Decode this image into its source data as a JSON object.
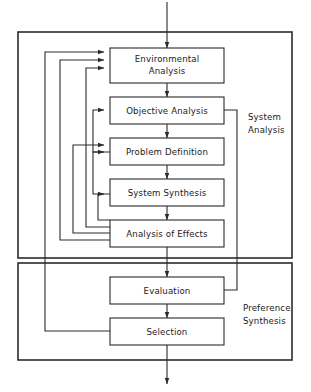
{
  "diagram": {
    "type": "flowchart",
    "colors": {
      "stroke": "#2b2b2b",
      "box_fill": "#ffffff",
      "background": "#ffffff",
      "text": "#1a1a1a"
    },
    "groups": [
      {
        "id": "system-analysis",
        "label_line1": "System",
        "label_line2": "Analysis",
        "label": "System Analysis"
      },
      {
        "id": "preference-synthesis",
        "label_line1": "Preference",
        "label_line2": "Synthesis",
        "label": "Preference Synthesis"
      }
    ],
    "nodes": [
      {
        "id": "environmental-analysis",
        "label_line1": "Environmental",
        "label_line2": "Analysis",
        "label": "Environmental Analysis",
        "group": "system-analysis"
      },
      {
        "id": "objective-analysis",
        "label_line1": "Objective Analysis",
        "label_line2": "",
        "label": "Objective Analysis",
        "group": "system-analysis"
      },
      {
        "id": "problem-definition",
        "label_line1": "Problem Definition",
        "label_line2": "",
        "label": "Problem Definition",
        "group": "system-analysis"
      },
      {
        "id": "system-synthesis",
        "label_line1": "System Synthesis",
        "label_line2": "",
        "label": "System Synthesis",
        "group": "system-analysis"
      },
      {
        "id": "analysis-of-effects",
        "label_line1": "Analysis of Effects",
        "label_line2": "",
        "label": "Analysis of Effects",
        "group": "system-analysis"
      },
      {
        "id": "evaluation",
        "label_line1": "Evaluation",
        "label_line2": "",
        "label": "Evaluation",
        "group": "preference-synthesis"
      },
      {
        "id": "selection",
        "label_line1": "Selection",
        "label_line2": "",
        "label": "Selection",
        "group": "preference-synthesis"
      }
    ],
    "edges": [
      {
        "id": "input-to-environmental",
        "from": "external-input",
        "to": "environmental-analysis",
        "kind": "forward"
      },
      {
        "id": "environmental-to-objective",
        "from": "environmental-analysis",
        "to": "objective-analysis",
        "kind": "forward"
      },
      {
        "id": "objective-to-problem",
        "from": "objective-analysis",
        "to": "problem-definition",
        "kind": "forward"
      },
      {
        "id": "problem-to-synthesis",
        "from": "problem-definition",
        "to": "system-synthesis",
        "kind": "forward"
      },
      {
        "id": "synthesis-to-effects",
        "from": "system-synthesis",
        "to": "analysis-of-effects",
        "kind": "forward"
      },
      {
        "id": "effects-to-evaluation",
        "from": "analysis-of-effects",
        "to": "evaluation",
        "kind": "forward"
      },
      {
        "id": "evaluation-to-selection",
        "from": "evaluation",
        "to": "selection",
        "kind": "forward"
      },
      {
        "id": "selection-to-output",
        "from": "selection",
        "to": "external-output",
        "kind": "forward"
      },
      {
        "id": "objective-to-evaluation",
        "from": "objective-analysis",
        "to": "evaluation",
        "kind": "bypass"
      },
      {
        "id": "effects-to-environmental",
        "from": "analysis-of-effects",
        "to": "environmental-analysis",
        "kind": "feedback"
      },
      {
        "id": "effects-to-objective",
        "from": "analysis-of-effects",
        "to": "objective-analysis",
        "kind": "feedback"
      },
      {
        "id": "effects-to-problem",
        "from": "analysis-of-effects",
        "to": "problem-definition",
        "kind": "feedback"
      },
      {
        "id": "effects-to-synthesis",
        "from": "analysis-of-effects",
        "to": "system-synthesis",
        "kind": "feedback"
      },
      {
        "id": "synthesis-to-problem",
        "from": "system-synthesis",
        "to": "problem-definition",
        "kind": "feedback"
      },
      {
        "id": "problem-to-environmental",
        "from": "problem-definition",
        "to": "environmental-analysis",
        "kind": "feedback"
      },
      {
        "id": "selection-to-environmental",
        "from": "selection",
        "to": "environmental-analysis",
        "kind": "feedback"
      }
    ]
  }
}
